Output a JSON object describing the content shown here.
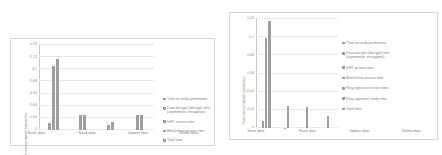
{
  "chart_data": [
    {
      "type": "bar",
      "title": "",
      "panel": "left",
      "xlabel": "",
      "ylabel": "Time consumption (seconds)",
      "categories": [
        "Store data",
        "Read data",
        "Update data",
        "Delete data"
      ],
      "ytick_labels": [
        "0",
        "0.02",
        "0.04",
        "0.06",
        "0.08",
        "0.1",
        "0.12",
        "0.14"
      ],
      "ytick_values": [
        0,
        0.02,
        0.04,
        0.06,
        0.08,
        0.1,
        0.12,
        0.14
      ],
      "ylim": [
        0,
        0.14
      ],
      "grid": true,
      "legend_position": "right",
      "series": [
        {
          "name": "Time to verify permission",
          "values": [
            0.0,
            0.0,
            0.0,
            0.0
          ]
        },
        {
          "name": "Data encrypt (decrypt) time\n(asymmetric encryption)",
          "values": [
            0.012,
            0.0,
            0.0,
            0.0
          ]
        },
        {
          "name": "DHT access time",
          "values": [
            0.105,
            0.0,
            0.008,
            0.0
          ]
        },
        {
          "name": "Blockchain access time",
          "values": [
            0.0,
            0.024,
            0.0,
            0.024
          ]
        },
        {
          "name": "Total time",
          "values": [
            0.117,
            0.024,
            0.013,
            0.024
          ]
        }
      ]
    },
    {
      "type": "bar",
      "title": "",
      "panel": "right",
      "xlabel": "",
      "ylabel": "Time consumption (seconds)",
      "categories": [
        "Store data",
        "Read data",
        "Update data",
        "Delete data"
      ],
      "ytick_labels": [
        "0",
        "0.02",
        "0.04",
        "0.06",
        "0.08",
        "0.1",
        "0.12"
      ],
      "ytick_values": [
        0,
        0.02,
        0.04,
        0.06,
        0.08,
        0.1,
        0.12
      ],
      "ylim": [
        0,
        0.12
      ],
      "grid": true,
      "legend_position": "right",
      "series": [
        {
          "name": "Time to verify permission",
          "values": [
            0.0,
            0.0,
            0.0,
            0.0
          ]
        },
        {
          "name": "Data encrypt (decrypt) time\n(asymmetric encryption)",
          "values": [
            0.008,
            0.0,
            0.0,
            0.0
          ]
        },
        {
          "name": "DHT access time",
          "values": [
            0.099,
            0.0005,
            0.0,
            0.0
          ]
        },
        {
          "name": "Blockchain access time",
          "values": [
            0.0,
            0.0,
            0.0,
            0.0
          ]
        },
        {
          "name": "Ring signature create time",
          "values": [
            0.0,
            0.0,
            0.0,
            0.0
          ]
        },
        {
          "name": "Ring signature verify time",
          "values": [
            0.0,
            0.0,
            0.0,
            0.0
          ]
        },
        {
          "name": "Total time",
          "values": [
            0.118,
            0.024,
            0.023,
            0.013
          ]
        }
      ]
    }
  ]
}
